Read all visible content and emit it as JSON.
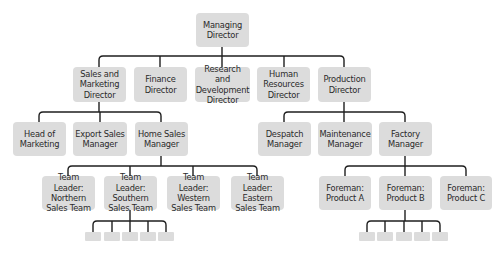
{
  "diagram": {
    "type": "org-chart",
    "colors": {
      "box": "#dcdcdc",
      "text": "#2b2b2b",
      "line": "#1f1f1f"
    },
    "root": {
      "label": "Managing Director"
    },
    "level1": [
      {
        "label": "Sales and Marketing Director"
      },
      {
        "label": "Finance Director"
      },
      {
        "label": "Research and Development Director"
      },
      {
        "label": "Human Resources Director"
      },
      {
        "label": "Production Director"
      }
    ],
    "sales_reports": [
      {
        "label": "Head of Marketing"
      },
      {
        "label": "Export Sales Manager"
      },
      {
        "label": "Home Sales Manager"
      }
    ],
    "production_reports": [
      {
        "label": "Despatch Manager"
      },
      {
        "label": "Maintenance Manager"
      },
      {
        "label": "Factory Manager"
      }
    ],
    "home_sales_reports": [
      {
        "label": "Team Leader: Northern Sales Team"
      },
      {
        "label": "Team Leader: Southern Sales Team"
      },
      {
        "label": "Team Leader: Western Sales Team"
      },
      {
        "label": "Team Leader: Eastern Sales Team"
      }
    ],
    "factory_reports": [
      {
        "label": "Foreman: Product A"
      },
      {
        "label": "Foreman: Product B"
      },
      {
        "label": "Foreman: Product C"
      }
    ],
    "southern_team_members_count": 5,
    "product_b_team_members_count": 5
  }
}
